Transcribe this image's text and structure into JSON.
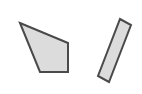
{
  "diagram": {
    "background": "#ffffff",
    "stroke_color": "#4a4a4a",
    "fill_color": "#dcdcdc",
    "stroke_width": 2,
    "shapes": [
      {
        "type": "quadrilateral",
        "points": "20,23 68,43 68,72 40,72"
      },
      {
        "type": "rectangle-rotated",
        "points": "120,19 131,25 109,82 98,76"
      }
    ]
  }
}
